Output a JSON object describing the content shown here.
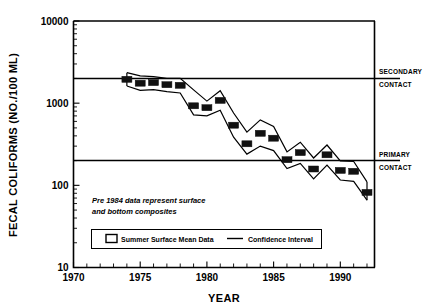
{
  "chart_data": {
    "type": "line",
    "title": "",
    "xlabel": "YEAR",
    "ylabel": "FECAL COLIFORMS (NO./100 ML)",
    "yscale": "log",
    "ylim": [
      10,
      10000
    ],
    "xlim": [
      1970,
      1992.6
    ],
    "grid": false,
    "legend_position": "bottom-center",
    "ytick_labels": [
      "10000",
      "1000",
      "100",
      "10"
    ],
    "ytick_values": [
      10000,
      1000,
      100,
      10
    ],
    "xtick_labels": [
      "1970",
      "1975",
      "1980",
      "1985",
      "1990"
    ],
    "xtick_values": [
      1970,
      1975,
      1980,
      1985,
      1990
    ],
    "x": [
      1974,
      1975,
      1976,
      1977,
      1978,
      1979,
      1980,
      1981,
      1982,
      1983,
      1984,
      1985,
      1986,
      1987,
      1988,
      1989,
      1990,
      1991,
      1992
    ],
    "series": [
      {
        "name": "Summer Surface Mean Data",
        "type": "scatter-marker",
        "values": [
          1950,
          1750,
          1780,
          1680,
          1650,
          930,
          880,
          1080,
          540,
          320,
          430,
          375,
          205,
          250,
          158,
          235,
          152,
          148,
          82
        ]
      },
      {
        "name": "Confidence Interval Upper",
        "type": "line",
        "values": [
          2350,
          2150,
          2100,
          2000,
          2000,
          1450,
          1060,
          1420,
          760,
          445,
          625,
          520,
          255,
          335,
          215,
          310,
          198,
          195,
          110
        ]
      },
      {
        "name": "Confidence Interval Lower",
        "type": "line",
        "values": [
          1620,
          1430,
          1460,
          1380,
          1330,
          720,
          700,
          820,
          385,
          240,
          300,
          265,
          160,
          185,
          120,
          176,
          116,
          112,
          66
        ]
      }
    ],
    "reference_lines": [
      {
        "name": "secondary-contact",
        "value": 2000,
        "label_line_1": "SECONDARY",
        "label_line_2": "CONTACT"
      },
      {
        "name": "primary-contact",
        "value": 200,
        "label_line_1": "PRIMARY",
        "label_line_2": "CONTACT"
      }
    ],
    "annotations": [
      {
        "name": "pre-1984-note",
        "line_1": "Pre 1984 data represent surface",
        "line_2": "and bottom composites"
      }
    ],
    "legend": {
      "marker_entry": "Summer Surface Mean Data",
      "line_entry": "Confidence Interval"
    },
    "colors": {
      "ink": "#000000",
      "background": "#ffffff",
      "marker": "#111111"
    }
  }
}
